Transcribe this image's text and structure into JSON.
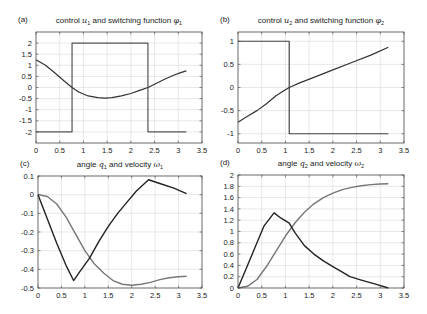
{
  "chart_data": [
    {
      "id": "a",
      "type": "line",
      "panel_label": "(a)",
      "title": "control u1 and switching function φ1",
      "title_parts": {
        "prefix": "control",
        "sym1": "u",
        "sub1": "1",
        "middle": "and switching function",
        "sym2": "φ",
        "sub2": "1"
      },
      "frame": {
        "left": 36,
        "top": 32,
        "right": 202,
        "bottom": 143
      },
      "xlim": [
        0,
        3.5
      ],
      "ylim": [
        -2.5,
        2.5
      ],
      "xticks": [
        0,
        0.5,
        1,
        1.5,
        2,
        2.5,
        3,
        3.5
      ],
      "yticks": [
        -2,
        -1.5,
        -1,
        -0.5,
        0,
        0.5,
        1,
        1.5,
        2
      ],
      "grid": true,
      "series": [
        {
          "name": "u1",
          "color": "#555555",
          "width": 1.2,
          "x": [
            0,
            0.76,
            0.76,
            2.36,
            2.36,
            3.17
          ],
          "y": [
            -2,
            -2,
            2,
            2,
            -2,
            -2
          ]
        },
        {
          "name": "phi1",
          "color": "#333333",
          "width": 1.2,
          "x": [
            0,
            0.2,
            0.4,
            0.6,
            0.76,
            0.9,
            1.1,
            1.3,
            1.45,
            1.6,
            1.8,
            2.0,
            2.2,
            2.36,
            2.5,
            2.7,
            2.9,
            3.05,
            3.17
          ],
          "y": [
            1.25,
            1.0,
            0.65,
            0.28,
            0.0,
            -0.2,
            -0.38,
            -0.46,
            -0.48,
            -0.46,
            -0.38,
            -0.27,
            -0.12,
            0.0,
            0.15,
            0.36,
            0.55,
            0.67,
            0.75
          ]
        }
      ]
    },
    {
      "id": "b",
      "type": "line",
      "panel_label": "(b)",
      "title": "control u2 and switching function φ2",
      "title_parts": {
        "prefix": "control",
        "sym1": "u",
        "sub1": "2",
        "middle": "and switching function",
        "sym2": "φ",
        "sub2": "2"
      },
      "frame": {
        "left": 238,
        "top": 32,
        "right": 404,
        "bottom": 143
      },
      "xlim": [
        0,
        3.5
      ],
      "ylim": [
        -1.2,
        1.2
      ],
      "xticks": [
        0,
        0.5,
        1,
        1.5,
        2,
        2.5,
        3,
        3.5
      ],
      "yticks": [
        -1,
        -0.5,
        0,
        0.5,
        1
      ],
      "grid": true,
      "series": [
        {
          "name": "u2",
          "color": "#444444",
          "width": 1.2,
          "x": [
            0,
            1.08,
            1.08,
            3.17
          ],
          "y": [
            1,
            1,
            -1,
            -1
          ]
        },
        {
          "name": "phi2",
          "color": "#333333",
          "width": 1.2,
          "x": [
            0,
            0.2,
            0.4,
            0.6,
            0.8,
            1.0,
            1.08,
            1.3,
            1.6,
            2.0,
            2.4,
            2.8,
            3.17
          ],
          "y": [
            -0.75,
            -0.62,
            -0.5,
            -0.35,
            -0.18,
            -0.05,
            0.0,
            0.1,
            0.22,
            0.38,
            0.54,
            0.7,
            0.87
          ]
        }
      ]
    },
    {
      "id": "c",
      "type": "line",
      "panel_label": "(c)",
      "title": "angle q1 and velocity ω1",
      "title_parts": {
        "prefix": "angle",
        "sym1": "q",
        "sub1": "1",
        "middle": "and velocity",
        "sym2": "ω",
        "sub2": "1"
      },
      "frame": {
        "left": 38,
        "top": 176,
        "right": 202,
        "bottom": 288
      },
      "xlim": [
        0,
        3.5
      ],
      "ylim": [
        -0.5,
        0.1
      ],
      "xticks": [
        0,
        0.5,
        1,
        1.5,
        2,
        2.5,
        3,
        3.5
      ],
      "yticks": [
        -0.5,
        -0.4,
        -0.3,
        -0.2,
        -0.1,
        0,
        0.1
      ],
      "grid": true,
      "series": [
        {
          "name": "q1",
          "color": "#777777",
          "width": 1.4,
          "x": [
            0,
            0.2,
            0.4,
            0.6,
            0.8,
            1.0,
            1.2,
            1.4,
            1.6,
            1.8,
            2.0,
            2.2,
            2.4,
            2.6,
            2.8,
            3.0,
            3.17
          ],
          "y": [
            0,
            -0.01,
            -0.05,
            -0.12,
            -0.21,
            -0.3,
            -0.37,
            -0.42,
            -0.46,
            -0.48,
            -0.485,
            -0.48,
            -0.47,
            -0.455,
            -0.445,
            -0.44,
            -0.437
          ]
        },
        {
          "name": "omega1",
          "color": "#222222",
          "width": 1.4,
          "x": [
            0,
            0.2,
            0.4,
            0.6,
            0.76,
            0.9,
            1.1,
            1.3,
            1.5,
            1.7,
            1.9,
            2.1,
            2.36,
            2.6,
            2.9,
            3.17
          ],
          "y": [
            0,
            -0.13,
            -0.26,
            -0.38,
            -0.46,
            -0.41,
            -0.34,
            -0.25,
            -0.17,
            -0.1,
            -0.04,
            0.02,
            0.08,
            0.06,
            0.035,
            0.005
          ]
        }
      ]
    },
    {
      "id": "d",
      "type": "line",
      "panel_label": "(d)",
      "title": "angle q2 and velocity ω2",
      "title_parts": {
        "prefix": "angle",
        "sym1": "q",
        "sub1": "2",
        "middle": "and velocity",
        "sym2": "ω",
        "sub2": "2"
      },
      "frame": {
        "left": 238,
        "top": 175,
        "right": 404,
        "bottom": 288
      },
      "xlim": [
        0,
        3.5
      ],
      "ylim": [
        0,
        2
      ],
      "xticks": [
        0,
        0.5,
        1,
        1.5,
        2,
        2.5,
        3,
        3.5
      ],
      "yticks": [
        0,
        0.2,
        0.4,
        0.6,
        0.8,
        1,
        1.2,
        1.4,
        1.6,
        1.8,
        2
      ],
      "grid": true,
      "series": [
        {
          "name": "q2",
          "color": "#777777",
          "width": 1.4,
          "x": [
            0,
            0.2,
            0.4,
            0.6,
            0.8,
            1.0,
            1.2,
            1.4,
            1.6,
            1.8,
            2.0,
            2.2,
            2.4,
            2.6,
            2.8,
            3.0,
            3.17
          ],
          "y": [
            0,
            0.03,
            0.15,
            0.38,
            0.65,
            0.92,
            1.15,
            1.34,
            1.49,
            1.6,
            1.68,
            1.74,
            1.78,
            1.81,
            1.83,
            1.84,
            1.845
          ]
        },
        {
          "name": "omega2",
          "color": "#222222",
          "width": 1.4,
          "x": [
            0,
            0.2,
            0.4,
            0.55,
            0.76,
            0.9,
            1.08,
            1.2,
            1.4,
            1.6,
            1.8,
            2.0,
            2.2,
            2.36,
            2.6,
            2.9,
            3.17
          ],
          "y": [
            0,
            0.4,
            0.8,
            1.1,
            1.33,
            1.24,
            1.15,
            0.98,
            0.75,
            0.6,
            0.48,
            0.38,
            0.28,
            0.2,
            0.14,
            0.07,
            0.0
          ]
        }
      ]
    }
  ],
  "colors": {
    "frame": "#444444",
    "grid": "#d8d8d8",
    "background": "#ffffff"
  }
}
